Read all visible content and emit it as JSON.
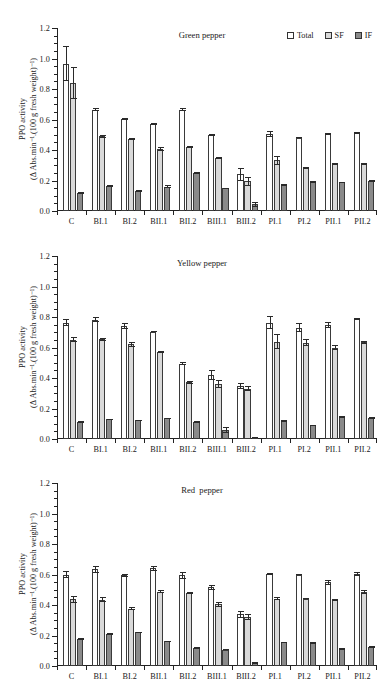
{
  "figure": {
    "y_axis_title_line1": "PPO activity",
    "y_axis_title_line2": "(Δ Abs.min⁻¹.(100 g fresh weight)⁻¹)",
    "legend": [
      {
        "key": "total",
        "label": "Total",
        "color": "#ffffff"
      },
      {
        "key": "sf",
        "label": "SF",
        "color": "#d9d9d9"
      },
      {
        "key": "if",
        "label": "IF",
        "color": "#8a8a8a"
      }
    ]
  },
  "chart_data": [
    {
      "type": "bar",
      "title": "Green pepper",
      "xlabel": "",
      "ylabel": "PPO activity (Δ Abs.min⁻¹.(100 g fresh weight)⁻¹)",
      "ylim": [
        0.0,
        1.2
      ],
      "yticks": [
        0.0,
        0.2,
        0.4,
        0.6,
        0.8,
        1.0,
        1.2
      ],
      "ytick_labels": [
        "0.0",
        "0.2",
        "0.4",
        "0.6",
        "0.8",
        "1.0",
        "1.2"
      ],
      "grid": false,
      "legend_position": "top-right",
      "categories": [
        "C",
        "BI.1",
        "BI.2",
        "BII.1",
        "BII.2",
        "BIII.1",
        "BIII.2",
        "PI.1",
        "PI.2",
        "PII.1",
        "PII.2"
      ],
      "series": [
        {
          "name": "Total",
          "values": [
            0.965,
            0.665,
            0.605,
            0.57,
            0.665,
            0.498,
            0.24,
            0.505,
            0.482,
            0.505,
            0.512
          ],
          "errors": [
            0.115,
            0.008,
            0.006,
            0.008,
            0.008,
            0.008,
            0.04,
            0.022,
            0.006,
            0.006,
            0.004
          ]
        },
        {
          "name": "SF",
          "values": [
            0.84,
            0.49,
            0.47,
            0.405,
            0.418,
            0.345,
            0.195,
            0.332,
            0.283,
            0.308,
            0.31
          ],
          "errors": [
            0.105,
            0.008,
            0.006,
            0.012,
            0.008,
            0.006,
            0.028,
            0.028,
            0.006,
            0.006,
            0.006
          ]
        },
        {
          "name": "IF",
          "values": [
            0.118,
            0.165,
            0.13,
            0.158,
            0.248,
            0.148,
            0.045,
            0.168,
            0.19,
            0.188,
            0.195
          ],
          "errors": [
            0.006,
            0.006,
            0.005,
            0.01,
            0.006,
            0.005,
            0.016,
            0.006,
            0.005,
            0.005,
            0.006
          ]
        }
      ]
    },
    {
      "type": "bar",
      "title": "Yellow pepper",
      "xlabel": "",
      "ylabel": "PPO activity (Δ Abs.min⁻¹.(100 g fresh weight)⁻¹)",
      "ylim": [
        0.0,
        1.2
      ],
      "yticks": [
        0.0,
        0.2,
        0.4,
        0.6,
        0.8,
        1.0,
        1.2
      ],
      "ytick_labels": [
        "0.0",
        "0.2",
        "0.4",
        "0.6",
        "0.8",
        "1.0",
        "1.2"
      ],
      "grid": false,
      "legend_position": "none",
      "categories": [
        "C",
        "BI.1",
        "BI.2",
        "BII.1",
        "BII.2",
        "BIII.1",
        "BIII.2",
        "PI.1",
        "PI.2",
        "PII.1",
        "PII.2"
      ],
      "series": [
        {
          "name": "Total",
          "values": [
            0.762,
            0.782,
            0.74,
            0.705,
            0.495,
            0.42,
            0.345,
            0.762,
            0.73,
            0.75,
            0.785
          ],
          "errors": [
            0.022,
            0.016,
            0.02,
            0.006,
            0.008,
            0.035,
            0.02,
            0.042,
            0.03,
            0.02,
            0.006
          ]
        },
        {
          "name": "SF",
          "values": [
            0.652,
            0.655,
            0.62,
            0.57,
            0.372,
            0.36,
            0.33,
            0.638,
            0.632,
            0.598,
            0.635
          ],
          "errors": [
            0.018,
            0.01,
            0.015,
            0.008,
            0.008,
            0.025,
            0.018,
            0.05,
            0.022,
            0.016,
            0.01
          ]
        },
        {
          "name": "IF",
          "values": [
            0.11,
            0.128,
            0.122,
            0.135,
            0.112,
            0.058,
            0.01,
            0.118,
            0.09,
            0.142,
            0.138
          ],
          "errors": [
            0.005,
            0.005,
            0.005,
            0.005,
            0.005,
            0.02,
            0.004,
            0.005,
            0.005,
            0.006,
            0.005
          ]
        }
      ]
    },
    {
      "type": "bar",
      "title": "Red  pepper",
      "xlabel": "",
      "ylabel": "PPO activity (Δ Abs.min⁻¹.(100 g fresh weight)⁻¹)",
      "ylim": [
        0.0,
        1.2
      ],
      "yticks": [
        0.0,
        0.2,
        0.4,
        0.6,
        0.8,
        1.0,
        1.2
      ],
      "ytick_labels": [
        "0.0",
        "0.2",
        "0.4",
        "0.6",
        "0.8",
        "1.0",
        "1.2"
      ],
      "grid": false,
      "legend_position": "none",
      "categories": [
        "C",
        "BI.1",
        "BI.2",
        "BII.1",
        "BII.2",
        "BIII.1",
        "BIII.2",
        "PI.1",
        "PI.2",
        "PII.1",
        "PII.2"
      ],
      "series": [
        {
          "name": "Total",
          "values": [
            0.6,
            0.635,
            0.595,
            0.64,
            0.595,
            0.515,
            0.338,
            0.602,
            0.6,
            0.548,
            0.602
          ],
          "errors": [
            0.022,
            0.022,
            0.01,
            0.014,
            0.022,
            0.018,
            0.022,
            0.006,
            0.004,
            0.018,
            0.012
          ]
        },
        {
          "name": "SF",
          "values": [
            0.438,
            0.435,
            0.375,
            0.488,
            0.478,
            0.405,
            0.322,
            0.442,
            0.442,
            0.432,
            0.485
          ],
          "errors": [
            0.022,
            0.018,
            0.01,
            0.012,
            0.006,
            0.018,
            0.02,
            0.008,
            0.005,
            0.008,
            0.012
          ]
        },
        {
          "name": "IF",
          "values": [
            0.178,
            0.208,
            0.22,
            0.162,
            0.118,
            0.108,
            0.02,
            0.155,
            0.152,
            0.112,
            0.125
          ],
          "errors": [
            0.006,
            0.006,
            0.005,
            0.005,
            0.005,
            0.005,
            0.008,
            0.005,
            0.005,
            0.008,
            0.005
          ]
        }
      ]
    }
  ]
}
